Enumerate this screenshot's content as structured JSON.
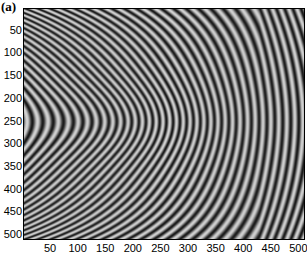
{
  "chart_data": {
    "type": "heatmap",
    "title": "",
    "panel_label": "(a)",
    "xlabel": "",
    "ylabel": "",
    "xlim": [
      1,
      512
    ],
    "ylim": [
      512,
      1
    ],
    "x_ticks": [
      50,
      100,
      150,
      200,
      250,
      300,
      350,
      400,
      450,
      500
    ],
    "y_ticks": [
      50,
      100,
      150,
      200,
      250,
      300,
      350,
      400,
      450,
      500
    ],
    "fringe_center": {
      "x": 150,
      "y": 250
    },
    "colormap": "gray",
    "grid": false
  }
}
